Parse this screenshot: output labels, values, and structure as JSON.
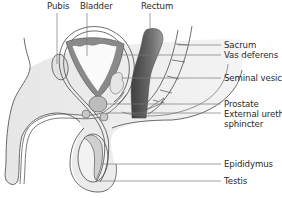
{
  "colors": {
    "outline": "#5a5a5a",
    "body_fill": "#ececec",
    "tissue_fill": "#f7f7f7",
    "bladder_wall": "#8a8a8a",
    "rectum_dark": "#555555",
    "gland_fill": "#bdbdbd",
    "leader_line": "#7a7a7a",
    "label_text": "#2a2a2a"
  },
  "labels": {
    "pubis": "Pubis",
    "bladder": "Bladder",
    "rectum": "Rectum",
    "sacrum": "Sacrum",
    "vas_deferens": "Vas deferens",
    "seminal_vesicle": "Seminal vesicle",
    "prostate": "Prostate",
    "external_urethral_sphincter_line1": "External urethral",
    "external_urethral_sphincter_line2": "sphincter",
    "epididymus": "Epididymus",
    "testis": "Testis"
  }
}
